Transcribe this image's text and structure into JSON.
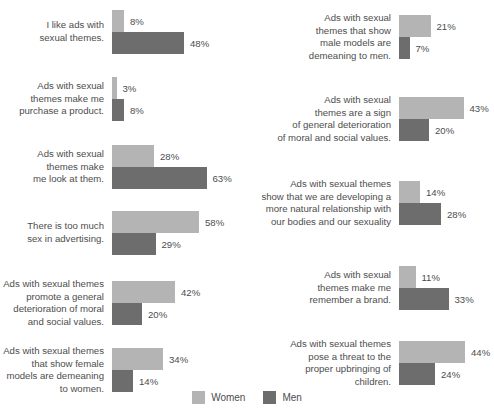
{
  "chart_data": {
    "type": "bar",
    "title": "",
    "xlabel": "",
    "ylabel": "",
    "orientation": "horizontal",
    "grid": false,
    "legend_position": "bottom-center",
    "value_suffix": "%",
    "xlim": [
      0,
      70
    ],
    "px_per_percent": 1.5,
    "legend": [
      {
        "name": "Women",
        "color": "#b4b4b4"
      },
      {
        "name": "Men",
        "color": "#6d6d6d"
      }
    ],
    "series": [
      {
        "name": "Women",
        "color": "#b4b4b4",
        "values": [
          8,
          3,
          28,
          58,
          42,
          34,
          21,
          43,
          14,
          11,
          44
        ]
      },
      {
        "name": "Men",
        "color": "#6d6d6d",
        "values": [
          48,
          8,
          63,
          29,
          20,
          14,
          7,
          20,
          28,
          33,
          24
        ]
      }
    ],
    "categories": [
      "I like ads with sexual themes.",
      "Ads with sexual themes make me purchase a product.",
      "Ads with sexual themes make me look at them.",
      "There is too much sex in advertising.",
      "Ads with sexual themes promote a general deterioration of moral and social values.",
      "Ads with sexual themes that show female models are demeaning to women.",
      "Ads with sexual themes that show male models are demeaning to men.",
      "Ads with sexual themes are a sign of general deterioration of moral and social values.",
      "Ads with sexual themes show that we are developing a more natural relationship with our bodies and our sexuality",
      "Ads with sexual themes make me remember a brand.",
      "Ads with sexual themes pose a threat to the proper upbringing of children."
    ]
  },
  "title_remnant": "",
  "left_column": [
    {
      "label_lines": [
        "I like ads with",
        "sexual themes."
      ],
      "top": 10,
      "women": {
        "value": 8,
        "label": "8%"
      },
      "men": {
        "value": 48,
        "label": "48%"
      }
    },
    {
      "label_lines": [
        "Ads with sexual",
        "themes make me",
        "purchase a product."
      ],
      "top": 77,
      "women": {
        "value": 3,
        "label": "3%"
      },
      "men": {
        "value": 8,
        "label": "8%"
      }
    },
    {
      "label_lines": [
        "Ads with sexual",
        "themes make",
        "me look at them."
      ],
      "top": 145,
      "women": {
        "value": 28,
        "label": "28%"
      },
      "men": {
        "value": 63,
        "label": "63%"
      }
    },
    {
      "label_lines": [
        "There is too much",
        "sex in advertising."
      ],
      "top": 211,
      "women": {
        "value": 58,
        "label": "58%"
      },
      "men": {
        "value": 29,
        "label": "29%"
      }
    },
    {
      "label_lines": [
        "Ads with sexual themes",
        "promote a general",
        "deterioration of moral",
        "and social values."
      ],
      "top": 278,
      "women": {
        "value": 42,
        "label": "42%"
      },
      "men": {
        "value": 20,
        "label": "20%"
      }
    },
    {
      "label_lines": [
        "Ads with sexual themes",
        "that show female",
        "models are demeaning",
        "to women."
      ],
      "top": 345,
      "women": {
        "value": 34,
        "label": "34%"
      },
      "men": {
        "value": 14,
        "label": "14%"
      }
    }
  ],
  "right_column": [
    {
      "label_lines": [
        "Ads with sexual",
        "themes that show",
        "male models are",
        "demeaning to men."
      ],
      "top": 12,
      "women": {
        "value": 21,
        "label": "21%"
      },
      "men": {
        "value": 7,
        "label": "7%"
      }
    },
    {
      "label_lines": [
        "Ads with sexual",
        "themes are a sign",
        "of general deterioration",
        "of moral and social values."
      ],
      "top": 94,
      "women": {
        "value": 43,
        "label": "43%"
      },
      "men": {
        "value": 20,
        "label": "20%"
      }
    },
    {
      "label_lines": [
        "Ads with sexual themes",
        "show that we are developing a",
        "more natural relationship with",
        "our bodies and our sexuality"
      ],
      "top": 178,
      "women": {
        "value": 14,
        "label": "14%"
      },
      "men": {
        "value": 28,
        "label": "28%"
      }
    },
    {
      "label_lines": [
        "Ads with sexual",
        "themes make me",
        "remember a brand."
      ],
      "top": 266,
      "women": {
        "value": 11,
        "label": "11%"
      },
      "men": {
        "value": 33,
        "label": "33%"
      }
    },
    {
      "label_lines": [
        "Ads with sexual themes",
        "pose a threat to the",
        "proper upbringing of",
        "children."
      ],
      "top": 338,
      "women": {
        "value": 44,
        "label": "44%"
      },
      "men": {
        "value": 24,
        "label": "24%"
      }
    }
  ],
  "legend": {
    "women_label": "Women",
    "men_label": "Men"
  }
}
